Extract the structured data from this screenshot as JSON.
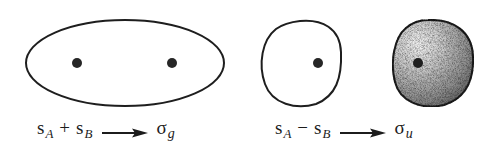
{
  "figure": {
    "width": 502,
    "height": 154,
    "colors": {
      "stroke": "#1e1e1e",
      "dot": "#262626",
      "shade_light": "#f2f2f2",
      "shade_dark": "#5a5a5a",
      "background": "#ffffff"
    },
    "panels": [
      {
        "id": "bonding",
        "shapes": [
          {
            "type": "ellipse",
            "shaded": false,
            "cx": 125,
            "cy": 63,
            "rx": 99,
            "ry": 43,
            "nuclei": [
              {
                "x": 77,
                "y": 63
              },
              {
                "x": 172,
                "y": 63
              }
            ]
          }
        ],
        "label": {
          "term1": {
            "symbol": "s",
            "subscript": "A"
          },
          "operator": "+",
          "term2": {
            "symbol": "s",
            "subscript": "B"
          },
          "arrow": "→",
          "result": {
            "symbol": "σ",
            "subscript": "g"
          }
        }
      },
      {
        "id": "antibonding",
        "shapes": [
          {
            "type": "rounded-blob",
            "shaded": false,
            "bounds": {
              "left": 262,
              "right": 342,
              "top": 20,
              "bottom": 106
            },
            "nuclei": [
              {
                "x": 318,
                "y": 63
              }
            ]
          },
          {
            "type": "rounded-blob",
            "shaded": true,
            "bounds": {
              "left": 393,
              "right": 474,
              "top": 20,
              "bottom": 106
            },
            "nuclei": [
              {
                "x": 418,
                "y": 63
              }
            ]
          }
        ],
        "label": {
          "term1": {
            "symbol": "s",
            "subscript": "A"
          },
          "operator": "−",
          "term2": {
            "symbol": "s",
            "subscript": "B"
          },
          "arrow": "→",
          "result": {
            "symbol": "σ",
            "subscript": "u"
          }
        }
      }
    ]
  }
}
